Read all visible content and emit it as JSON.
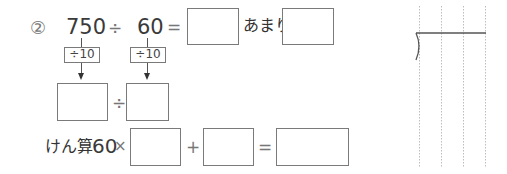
{
  "problem": {
    "number": "②",
    "dividend": "750",
    "divide_sign": "÷",
    "divisor": "60",
    "equals": "=",
    "remainder_label": "あまり",
    "step_dividend": "÷10",
    "step_divisor": "÷10",
    "reduced_divide_sign": "÷",
    "check_label": "けん算",
    "check_multiplier": "60",
    "times_sign": "×",
    "plus_sign": "+",
    "check_equals": "="
  },
  "answer_boxes": {
    "quotient": "",
    "remainder": "",
    "reduced_dividend": "",
    "reduced_divisor": "",
    "check_quotient": "",
    "check_remainder": "",
    "check_result": ""
  },
  "colors": {
    "box_border": "#7a7a7a",
    "text": "#3a3a3a",
    "grid_dots": "#bdbdbd"
  }
}
